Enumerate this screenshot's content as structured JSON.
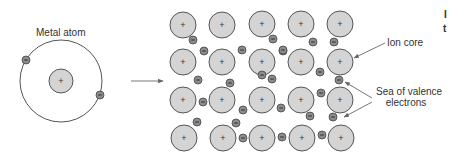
{
  "labels": {
    "metal_atom": "Metal atom",
    "ion_core": "Ion core",
    "sea_line1": "Sea of valence",
    "sea_line2": "electrons",
    "edge_fragment_1": "I",
    "edge_fragment_2": "t"
  },
  "symbols": {
    "positive": "+",
    "negative": "−"
  },
  "colors": {
    "ion_fill": "#d4d4d4",
    "ion_stroke": "#555555",
    "electron_fill": "#8c8c8c",
    "electron_stroke": "#444444",
    "line": "#666666",
    "text": "#333333"
  },
  "atom": {
    "orbit": {
      "cx": 61,
      "cy": 81,
      "r": 41
    },
    "nucleus": {
      "cx": 61,
      "cy": 81,
      "r": 12
    },
    "electrons": [
      {
        "cx": 26,
        "cy": 60
      },
      {
        "cx": 100,
        "cy": 95
      }
    ]
  },
  "lattice": {
    "ion_radius": 13,
    "electron_radius": 4,
    "ions": [
      {
        "cx": 183,
        "cy": 25
      },
      {
        "cx": 222,
        "cy": 25
      },
      {
        "cx": 262,
        "cy": 24
      },
      {
        "cx": 301,
        "cy": 24
      },
      {
        "cx": 340,
        "cy": 24
      },
      {
        "cx": 183,
        "cy": 62
      },
      {
        "cx": 222,
        "cy": 62
      },
      {
        "cx": 262,
        "cy": 62
      },
      {
        "cx": 301,
        "cy": 62
      },
      {
        "cx": 340,
        "cy": 62
      },
      {
        "cx": 183,
        "cy": 100
      },
      {
        "cx": 222,
        "cy": 100
      },
      {
        "cx": 262,
        "cy": 100
      },
      {
        "cx": 301,
        "cy": 100
      },
      {
        "cx": 340,
        "cy": 100
      },
      {
        "cx": 184,
        "cy": 138
      },
      {
        "cx": 223,
        "cy": 138
      },
      {
        "cx": 262,
        "cy": 138
      },
      {
        "cx": 302,
        "cy": 138
      },
      {
        "cx": 341,
        "cy": 138
      }
    ],
    "electrons": [
      {
        "cx": 193,
        "cy": 40
      },
      {
        "cx": 204,
        "cy": 51
      },
      {
        "cx": 242,
        "cy": 50
      },
      {
        "cx": 273,
        "cy": 39
      },
      {
        "cx": 283,
        "cy": 51
      },
      {
        "cx": 313,
        "cy": 42
      },
      {
        "cx": 334,
        "cy": 42
      },
      {
        "cx": 283,
        "cy": 50
      },
      {
        "cx": 198,
        "cy": 80
      },
      {
        "cx": 230,
        "cy": 83
      },
      {
        "cx": 272,
        "cy": 79
      },
      {
        "cx": 320,
        "cy": 72
      },
      {
        "cx": 339,
        "cy": 80
      },
      {
        "cx": 203,
        "cy": 102
      },
      {
        "cx": 243,
        "cy": 110
      },
      {
        "cx": 281,
        "cy": 108
      },
      {
        "cx": 321,
        "cy": 93
      },
      {
        "cx": 262,
        "cy": 75
      },
      {
        "cx": 197,
        "cy": 122
      },
      {
        "cx": 236,
        "cy": 123
      },
      {
        "cx": 310,
        "cy": 116
      },
      {
        "cx": 333,
        "cy": 117
      },
      {
        "cx": 282,
        "cy": 137
      },
      {
        "cx": 322,
        "cy": 135
      },
      {
        "cx": 243,
        "cy": 138
      }
    ]
  },
  "arrows": {
    "transition": {
      "x1": 131,
      "y1": 81,
      "x2": 163,
      "y2": 81
    },
    "ion_core_pointer": {
      "x1": 385,
      "y1": 43,
      "x2": 354,
      "y2": 58
    },
    "sea_pointer_1": {
      "x1": 372,
      "y1": 98,
      "x2": 345,
      "y2": 82
    },
    "sea_pointer_2": {
      "x1": 372,
      "y1": 102,
      "x2": 344,
      "y2": 117
    }
  }
}
